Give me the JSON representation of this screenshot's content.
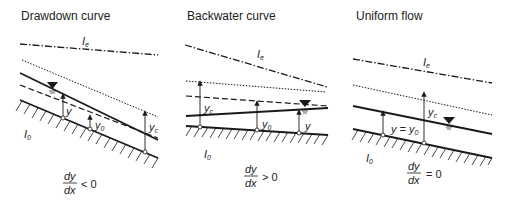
{
  "panels": [
    {
      "title": "Drawdown curve",
      "energy_label": "I",
      "energy_sub": "e",
      "bed_label": "I",
      "bed_sub": "0",
      "depth_labels": {
        "y": "y",
        "y0": "y",
        "y0_sub": "0",
        "yc": "y",
        "yc_sub": "c"
      },
      "equation": {
        "num": "dy",
        "den": "dx",
        "rel": "< 0"
      }
    },
    {
      "title": "Backwater curve",
      "energy_label": "I",
      "energy_sub": "e",
      "bed_label": "I",
      "bed_sub": "0",
      "depth_labels": {
        "y": "y",
        "y0": "y",
        "y0_sub": "0",
        "yc": "y",
        "yc_sub": "c"
      },
      "equation": {
        "num": "dy",
        "den": "dx",
        "rel": "> 0"
      }
    },
    {
      "title": "Uniform flow",
      "energy_label": "I",
      "energy_sub": "e",
      "bed_label": "I",
      "bed_sub": "0",
      "depth_labels": {
        "yeq": "y = y",
        "yeq_sub": "0",
        "yc": "y",
        "yc_sub": "c"
      },
      "equation": {
        "num": "dy",
        "den": "dx",
        "rel": "= 0"
      }
    }
  ],
  "legend_semantics": {
    "dash_dot": "energy line I_e",
    "dotted": "critical depth line y_c",
    "dashed": "normal depth line y_0",
    "solid": "water surface",
    "hatched": "channel bed I_0"
  },
  "colors": {
    "line": "#1a1a1a",
    "background": "#ffffff"
  }
}
